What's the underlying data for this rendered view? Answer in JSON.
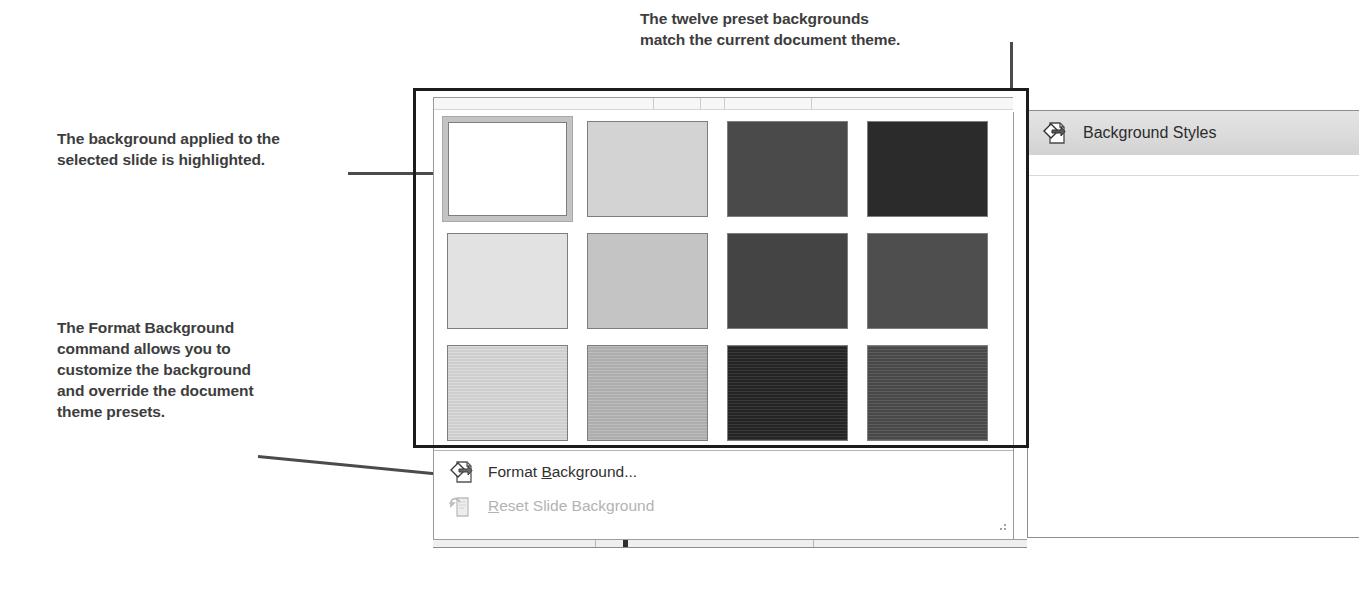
{
  "annotations": {
    "top": "The twelve preset backgrounds\nmatch the current document theme.",
    "left_top": "The background applied to the\nselected slide is highlighted.",
    "left_bottom": "The Format Background\ncommand allows you to\ncustomize the background\nand override the document\ntheme presets."
  },
  "gallery": {
    "name": "background-styles-gallery",
    "selected_index": 0,
    "rows": [
      {
        "swatches": [
          {
            "name": "style-1",
            "color": "#ffffff",
            "selected": true
          },
          {
            "name": "style-2",
            "color": "#d3d3d3",
            "selected": false
          },
          {
            "name": "style-3",
            "color": "#4a4a4a",
            "selected": false
          },
          {
            "name": "style-4",
            "color": "#2b2b2b",
            "selected": false
          }
        ]
      },
      {
        "swatches": [
          {
            "name": "style-5",
            "color": "#e2e2e2",
            "selected": false
          },
          {
            "name": "style-6",
            "color": "#c4c4c4",
            "selected": false
          },
          {
            "name": "style-7",
            "color": "#444444",
            "selected": false
          },
          {
            "name": "style-8",
            "color": "#4e4e4e",
            "selected": false
          }
        ]
      },
      {
        "swatches": [
          {
            "name": "style-9",
            "color": "#d9d9d9",
            "selected": false
          },
          {
            "name": "style-10",
            "color": "#b6b6b6",
            "selected": false
          },
          {
            "name": "style-11",
            "color": "#262626",
            "selected": false
          },
          {
            "name": "style-12",
            "color": "#4c4c4c",
            "selected": false
          }
        ]
      }
    ]
  },
  "menu": {
    "items": [
      {
        "name": "format-background",
        "label_pre": "Format ",
        "label_accel": "B",
        "label_post": "ackground...",
        "icon": "paint-bucket-page-icon",
        "enabled": true
      },
      {
        "name": "reset-slide-background",
        "label_pre": "",
        "label_accel": "R",
        "label_post": "eset Slide Background",
        "icon": "undo-page-icon",
        "enabled": false
      }
    ]
  },
  "right_panel": {
    "button_label": "Background Styles",
    "button_icon": "paint-bucket-page-icon"
  },
  "colors": {
    "emphasis_box": "#1c1c1c",
    "leader_line": "#4b4b4b",
    "annotation_text": "#3d3d3d",
    "selected_swatch_highlight": "#c3c3c3",
    "disabled_text": "#b3b3b3"
  }
}
